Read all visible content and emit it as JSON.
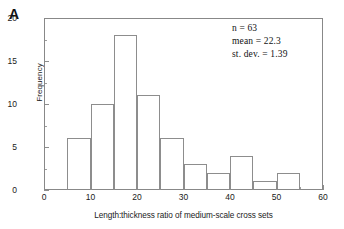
{
  "figure": {
    "panel_label": "A",
    "background_color": "#ffffff",
    "frame_color": "#888888",
    "bar_outline_color": "#8d8d8d",
    "text_color": "#1a1a1a"
  },
  "annotations": {
    "n_label": "n = 63",
    "mean_label": "mean = 22.3",
    "stdev_label": "st. dev. = 1.39"
  },
  "chart_data": {
    "type": "bar",
    "title": "",
    "subtitle": "",
    "xlabel": "Length:thickness ratio of medium-scale cross sets",
    "ylabel": "Frequency",
    "xlim": [
      0,
      60
    ],
    "ylim": [
      0,
      20
    ],
    "grid": false,
    "legend": null,
    "bin_width": 5,
    "histogram": true,
    "x_ticks_major": [
      0,
      10,
      20,
      30,
      40,
      50,
      60
    ],
    "x_ticks_minor": [
      5,
      15,
      25,
      35,
      45,
      55
    ],
    "y_ticks_major": [
      0,
      5,
      10,
      15,
      20
    ],
    "y_ticks_minor": [
      2.5,
      7.5,
      12.5,
      17.5
    ],
    "x_tick_labels": [
      "0",
      "10",
      "20",
      "30",
      "40",
      "50",
      "60"
    ],
    "y_tick_labels": [
      "0",
      "5",
      "10",
      "15",
      "20"
    ],
    "categories": [
      "5-10",
      "10-15",
      "15-20",
      "20-25",
      "25-30",
      "30-35",
      "35-40",
      "40-45",
      "45-50",
      "50-55"
    ],
    "bin_edges": [
      5,
      10,
      15,
      20,
      25,
      30,
      35,
      40,
      45,
      50,
      55
    ],
    "values": [
      6,
      10,
      18,
      11,
      6,
      3,
      2,
      4,
      1,
      2
    ],
    "bars": [
      {
        "x0": 5,
        "x1": 10,
        "value": 6
      },
      {
        "x0": 10,
        "x1": 15,
        "value": 10
      },
      {
        "x0": 15,
        "x1": 20,
        "value": 18
      },
      {
        "x0": 20,
        "x1": 25,
        "value": 11
      },
      {
        "x0": 25,
        "x1": 30,
        "value": 6
      },
      {
        "x0": 30,
        "x1": 35,
        "value": 3
      },
      {
        "x0": 35,
        "x1": 40,
        "value": 2
      },
      {
        "x0": 40,
        "x1": 45,
        "value": 4
      },
      {
        "x0": 45,
        "x1": 50,
        "value": 1
      },
      {
        "x0": 50,
        "x1": 55,
        "value": 2
      }
    ],
    "annotations": [
      "n = 63",
      "mean = 22.3",
      "st. dev. = 1.39"
    ],
    "statistics": {
      "n": 63,
      "mean": 22.3,
      "st_dev": 1.39
    }
  }
}
